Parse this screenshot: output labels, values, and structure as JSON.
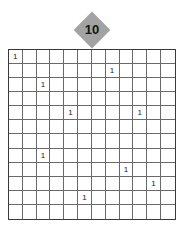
{
  "puzzle": {
    "number": "10",
    "badge_color": "#a3a3a3",
    "rows": 12,
    "cols": 12,
    "clues": [
      {
        "row": 0,
        "col": 0,
        "value": "1"
      },
      {
        "row": 1,
        "col": 7,
        "value": "1"
      },
      {
        "row": 2,
        "col": 2,
        "value": "1"
      },
      {
        "row": 4,
        "col": 4,
        "value": "1"
      },
      {
        "row": 4,
        "col": 9,
        "value": "1"
      },
      {
        "row": 7,
        "col": 2,
        "value": "1"
      },
      {
        "row": 8,
        "col": 8,
        "value": "1"
      },
      {
        "row": 9,
        "col": 10,
        "value": "1"
      },
      {
        "row": 10,
        "col": 5,
        "value": "1"
      }
    ]
  }
}
